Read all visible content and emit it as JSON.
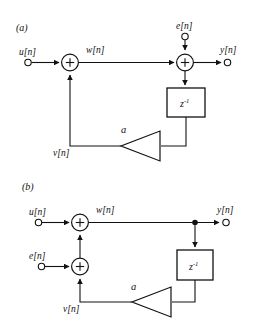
{
  "figure": {
    "type": "signal-flow-block-diagram",
    "background_color": "#ffffff",
    "line_color": "#111111",
    "panels": [
      {
        "id": "a",
        "label": "(a)",
        "signals": {
          "input": "u[n]",
          "noise": "e[n]",
          "intermediate": "w[n]",
          "feedback": "v[n]",
          "output": "y[n]"
        },
        "blocks": {
          "delay": "z",
          "delay_exponent": "-1",
          "gain": "a",
          "adder_symbol": "+"
        },
        "description": "u[n] enters first adder with feedback v[n]; sum w[n] goes to second adder where e[n] is added; result y[n] also feeds a z-inverse delay whose output passes through gain a back to the first adder as v[n]."
      },
      {
        "id": "b",
        "label": "(b)",
        "signals": {
          "input": "u[n]",
          "noise": "e[n]",
          "intermediate": "w[n]",
          "feedback": "v[n]",
          "output": "y[n]"
        },
        "blocks": {
          "delay": "z",
          "delay_exponent": "-1",
          "gain": "a",
          "adder_symbol": "+"
        },
        "description": "e[n] is added to feedback v[n] in a lower adder; that sum enters the upper adder with u[n]; the sum w[n] equals y[n] and is tapped to a z-inverse delay feeding gain a back as v[n]."
      }
    ]
  }
}
